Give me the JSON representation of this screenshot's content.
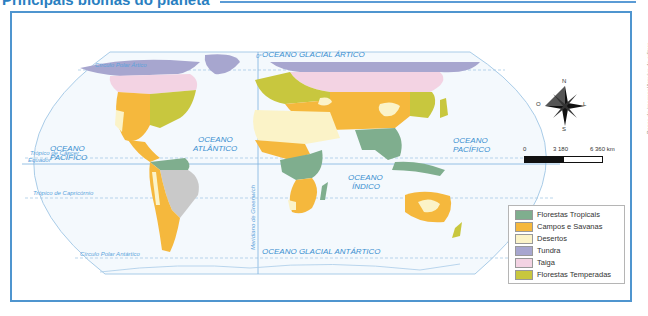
{
  "title": "Principais biomas do planeta",
  "credit": "Banco de imagens/Arquivo da editora",
  "oceans": {
    "arctic": "OCEANO GLACIAL ÁRTICO",
    "pacific_west": [
      "OCEANO",
      "PACÍFICO"
    ],
    "atlantic": [
      "OCEANO",
      "ATLÂNTICO"
    ],
    "indian": [
      "OCEANO",
      "ÍNDICO"
    ],
    "pacific_east": [
      "OCEANO",
      "PACÍFICO"
    ],
    "antarctic": "OCEANO GLACIAL ANTÁRTICO"
  },
  "lines": {
    "arctic_circle": "Círculo Polar Ártico",
    "cancer": "Trópico de Câncer",
    "equator": "Equador",
    "capricorn": "Trópico de Capricórnio",
    "antarctic_circle": "Círculo Polar Antártico",
    "greenwich": "Meridiano de Greenwich",
    "zero": "0°"
  },
  "compass": {
    "n": "N",
    "s": "S",
    "o": "O",
    "l": "L"
  },
  "scale": {
    "start": "0",
    "mid": "3 180",
    "end": "6 360 km"
  },
  "legend": {
    "items": [
      {
        "label": "Florestas Tropicais",
        "color": "#7fae8e"
      },
      {
        "label": "Campos e Savanas",
        "color": "#f5b83d"
      },
      {
        "label": "Desertos",
        "color": "#fbf3c8"
      },
      {
        "label": "Tundra",
        "color": "#a7a6cf"
      },
      {
        "label": "Taiga",
        "color": "#f3d3e3"
      },
      {
        "label": "Florestas Temperadas",
        "color": "#c8c73e"
      }
    ]
  },
  "colors": {
    "frame": "#4f95cf",
    "ocean_text": "#3a8fd0",
    "unlabeled_land": "#c9c9c9"
  }
}
